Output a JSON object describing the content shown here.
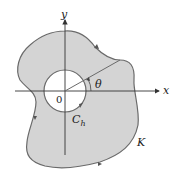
{
  "diagram": {
    "type": "region-with-hole",
    "labels": {
      "y_axis": "y",
      "x_axis": "x",
      "origin": "0",
      "angle": "θ",
      "inner_curve": "C",
      "inner_curve_sub": "h",
      "outer_curve": "K"
    },
    "colors": {
      "region_fill": "#d4d4d4",
      "boundary": "#6a6a6a",
      "axes": "#333333",
      "hole": "#ffffff"
    },
    "elements": [
      {
        "id": "outer-boundary",
        "label": "K",
        "orientation": "counterclockwise"
      },
      {
        "id": "inner-boundary",
        "label": "C_h",
        "shape": "circle",
        "orientation": "clockwise"
      },
      {
        "id": "ray",
        "from": "origin",
        "angle_label": "θ"
      }
    ]
  }
}
